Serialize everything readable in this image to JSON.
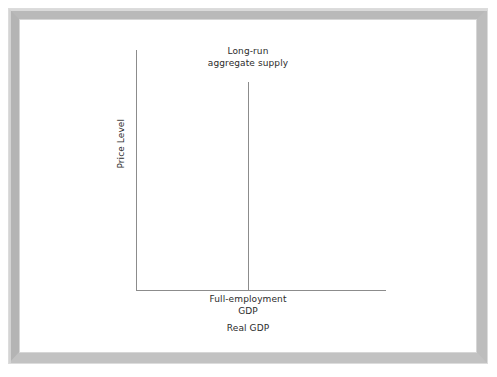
{
  "figure": {
    "frame_color": "#b9b9b9",
    "background_color": "#ffffff",
    "line_color": "#8c8c8c",
    "text_color": "#2b2b2b"
  },
  "chart_data": {
    "type": "line",
    "title": "",
    "subtitle": "",
    "xlabel": "Real GDP",
    "ylabel": "Price Level",
    "grid": false,
    "legend": "none",
    "annotations": [
      {
        "name": "lras-curve-label",
        "text": "Long-run\naggregate supply",
        "line1": "Long-run",
        "line2": "aggregate supply"
      },
      {
        "name": "full-employment-tick-label",
        "text": "Full-employment\nGDP",
        "line1": "Full-employment",
        "line2": "GDP"
      }
    ],
    "series": [
      {
        "name": "Long-run aggregate supply",
        "shape": "vertical",
        "x": [
          "Full-employment GDP",
          "Full-employment GDP"
        ],
        "y": [
          0,
          1
        ],
        "description": "Vertical line at full-employment GDP spanning the full price-level range"
      }
    ],
    "axes": {
      "x": {
        "label": "Real GDP",
        "ticks": [
          "Full-employment GDP"
        ],
        "tick_values": [],
        "arrow": false
      },
      "y": {
        "label": "Price Level",
        "ticks": [],
        "tick_values": [],
        "arrow": false
      }
    }
  },
  "labels": {
    "lras": "Long-run\naggregate supply",
    "full_employment_gdp": "Full-employment\nGDP",
    "real_gdp": "Real GDP",
    "price_level": "Price Level"
  }
}
